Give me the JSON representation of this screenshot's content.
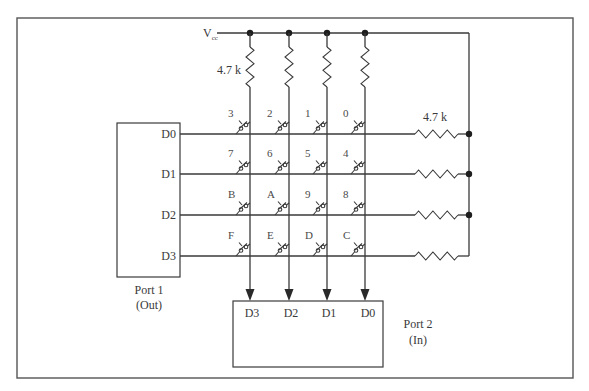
{
  "diagram": {
    "type": "hex-keypad-matrix-schematic",
    "colors": {
      "wire": "#3a3a3a",
      "frame": "#555555",
      "background": "#ffffff"
    },
    "vcc": {
      "label": "V",
      "subscript": "cc"
    },
    "pullup_label": "4.7 k",
    "row_resistor_label": "4.7 k",
    "columns": [
      {
        "x": 250,
        "port2_label": "D3"
      },
      {
        "x": 289,
        "port2_label": "D2"
      },
      {
        "x": 327,
        "port2_label": "D1"
      },
      {
        "x": 365,
        "port2_label": "D0"
      }
    ],
    "rows": [
      {
        "y": 134,
        "port1_label": "D0",
        "keys": [
          "3",
          "2",
          "1",
          "0"
        ]
      },
      {
        "y": 174,
        "port1_label": "D1",
        "keys": [
          "7",
          "6",
          "5",
          "4"
        ]
      },
      {
        "y": 215,
        "port1_label": "D2",
        "keys": [
          "B",
          "A",
          "9",
          "8"
        ]
      },
      {
        "y": 256,
        "port1_label": "D3",
        "keys": [
          "F",
          "E",
          "D",
          "C"
        ]
      }
    ],
    "port1": {
      "name": "Port 1",
      "direction": "(Out)"
    },
    "port2": {
      "name": "Port 2",
      "direction": "(In)"
    }
  }
}
